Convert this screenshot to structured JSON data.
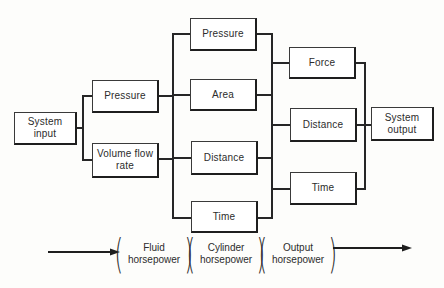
{
  "diagram": {
    "type": "block-flow",
    "columns": [
      {
        "id": "input",
        "nodes": [
          {
            "id": "system-input",
            "line1": "System",
            "line2": "input"
          }
        ]
      },
      {
        "id": "fluid",
        "nodes": [
          {
            "id": "pressure-1",
            "line1": "Pressure",
            "line2": ""
          },
          {
            "id": "volume-flow-rate",
            "line1": "Volume flow",
            "line2": "rate"
          }
        ]
      },
      {
        "id": "cylinder",
        "nodes": [
          {
            "id": "pressure-2",
            "line1": "Pressure",
            "line2": ""
          },
          {
            "id": "area",
            "line1": "Area",
            "line2": ""
          },
          {
            "id": "distance-1",
            "line1": "Distance",
            "line2": ""
          },
          {
            "id": "time-1",
            "line1": "Time",
            "line2": ""
          }
        ]
      },
      {
        "id": "output-terms",
        "nodes": [
          {
            "id": "force",
            "line1": "Force",
            "line2": ""
          },
          {
            "id": "distance-2",
            "line1": "Distance",
            "line2": ""
          },
          {
            "id": "time-2",
            "line1": "Time",
            "line2": ""
          }
        ]
      },
      {
        "id": "output",
        "nodes": [
          {
            "id": "system-output",
            "line1": "System",
            "line2": "output"
          }
        ]
      }
    ],
    "edges": [
      [
        "system-input",
        "pressure-1"
      ],
      [
        "system-input",
        "volume-flow-rate"
      ],
      [
        "pressure-1",
        "pressure-2"
      ],
      [
        "pressure-1",
        "area"
      ],
      [
        "volume-flow-rate",
        "distance-1"
      ],
      [
        "volume-flow-rate",
        "time-1"
      ],
      [
        "pressure-2",
        "force"
      ],
      [
        "area",
        "force"
      ],
      [
        "distance-1",
        "distance-2"
      ],
      [
        "time-1",
        "time-2"
      ],
      [
        "force",
        "system-output"
      ],
      [
        "distance-2",
        "system-output"
      ],
      [
        "time-2",
        "system-output"
      ]
    ],
    "legend": {
      "groups": [
        {
          "id": "fluid-hp",
          "line1": "Fluid",
          "line2": "horsepower"
        },
        {
          "id": "cylinder-hp",
          "line1": "Cylinder",
          "line2": "horsepower"
        },
        {
          "id": "output-hp",
          "line1": "Output",
          "line2": "horsepower"
        }
      ]
    },
    "colors": {
      "line": "#262626",
      "box_fill": "#ffffff",
      "background": "#fdfdfb",
      "text": "#2c2c2c"
    }
  }
}
